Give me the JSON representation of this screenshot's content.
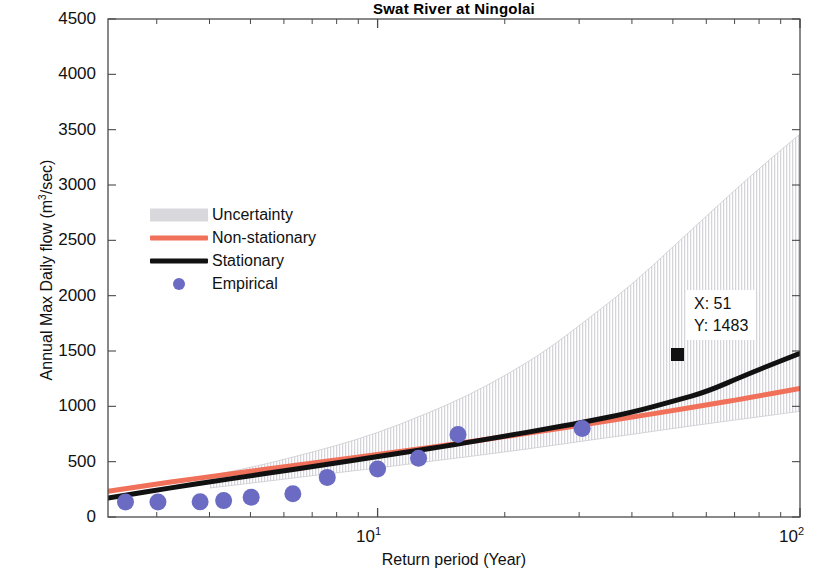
{
  "chart_data": {
    "type": "line",
    "title": "Swat River at Ningolai",
    "xlabel": "Return period (Year)",
    "ylabel_text": "Annual Max  Daily flow (m",
    "ylabel_sup": "3",
    "ylabel_tail": "/sec)",
    "xscale": "log",
    "yscale": "linear",
    "xlim": [
      2.3,
      100
    ],
    "ylim": [
      0,
      4500
    ],
    "yticks": [
      0,
      500,
      1000,
      1500,
      2000,
      2500,
      3000,
      3500,
      4000,
      4500
    ],
    "ytick_labels": [
      "0",
      "500",
      "1000",
      "1500",
      "2000",
      "2500",
      "3000",
      "3500",
      "4000",
      "4500"
    ],
    "xtick_major": [
      10,
      100
    ],
    "xtick_labels": [
      "10",
      "10"
    ],
    "xtick_exponents": [
      "1",
      "2"
    ],
    "grid": false,
    "legend_position": "center-left",
    "legend": [
      {
        "label": "Uncertainty",
        "kind": "patch",
        "color": "#d9d9dd"
      },
      {
        "label": "Non-stationary",
        "kind": "line",
        "color": "#f0705a"
      },
      {
        "label": "Stationary",
        "kind": "line",
        "color": "#111111"
      },
      {
        "label": "Empirical",
        "kind": "marker",
        "color": "#6b6bc4"
      }
    ],
    "series": [
      {
        "name": "Stationary",
        "color": "#111111",
        "type": "line",
        "x": [
          2.3,
          2.6,
          3.0,
          3.5,
          4.0,
          5.0,
          6.0,
          7.0,
          8.0,
          10.0,
          12.0,
          15.0,
          20.0,
          25.0,
          30.0,
          40.0,
          51.0,
          60.0,
          75.0,
          100.0
        ],
        "y": [
          172,
          205,
          243,
          283,
          317,
          372,
          417,
          455,
          489,
          545,
          592,
          650,
          730,
          795,
          850,
          945,
          1483,
          1130,
          1290,
          1480
        ]
      },
      {
        "name": "Non-stationary",
        "color": "#f0705a",
        "type": "line",
        "x": [
          2.3,
          2.6,
          3.0,
          3.5,
          4.0,
          5.0,
          6.0,
          7.0,
          8.0,
          10.0,
          12.0,
          15.0,
          20.0,
          25.0,
          30.0,
          40.0,
          50.0,
          60.0,
          75.0,
          100.0
        ],
        "y": [
          232,
          263,
          298,
          334,
          364,
          413,
          453,
          487,
          516,
          565,
          606,
          657,
          726,
          781,
          827,
          902,
          962,
          1012,
          1075,
          1162
        ]
      },
      {
        "name": "Empirical",
        "color": "#6b6bc4",
        "type": "scatter",
        "x": [
          2.53,
          3.02,
          3.8,
          4.32,
          5.02,
          6.3,
          7.6,
          10.0,
          12.5,
          15.5,
          30.5
        ],
        "y": [
          136,
          136,
          137,
          148,
          178,
          210,
          358,
          434,
          530,
          745,
          800
        ]
      }
    ],
    "uncertainty_band": {
      "name": "Uncertainty",
      "color": "#d9d9dd",
      "x": [
        4.0,
        5.0,
        6.0,
        8.0,
        10.0,
        13.0,
        16.0,
        20.0,
        25.0,
        32.0,
        40.0,
        50.0,
        65.0,
        80.0,
        100.0
      ],
      "upper": [
        372,
        447,
        520,
        645,
        760,
        930,
        1080,
        1275,
        1500,
        1810,
        2100,
        2440,
        2840,
        3150,
        3460
      ],
      "lower": [
        262,
        305,
        342,
        400,
        442,
        498,
        540,
        588,
        637,
        697,
        746,
        800,
        860,
        905,
        955
      ]
    },
    "datatip": {
      "x_label": "X: 51",
      "y_label": "Y: 1483",
      "x_value": 51,
      "y_value": 1483
    }
  }
}
